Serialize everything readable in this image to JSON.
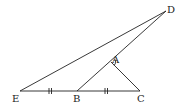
{
  "diagram": {
    "type": "geometry",
    "points": {
      "D": {
        "label": "D",
        "x": 166,
        "y": 11
      },
      "A": {
        "label": "A",
        "x": 111,
        "y": 62
      },
      "E": {
        "label": "E",
        "x": 20,
        "y": 91
      },
      "B": {
        "label": "B",
        "x": 77,
        "y": 91
      },
      "C": {
        "label": "C",
        "x": 140,
        "y": 91
      }
    },
    "segments": [
      "ED",
      "BD",
      "AC",
      "EC"
    ],
    "equal_marks": [
      {
        "segment": "EB",
        "mark": "||"
      },
      {
        "segment": "BC",
        "mark": "||"
      }
    ],
    "angle_marks": [
      {
        "vertex": "A",
        "between": [
          "AD",
          "AC"
        ]
      }
    ],
    "line_color": "#222222"
  }
}
